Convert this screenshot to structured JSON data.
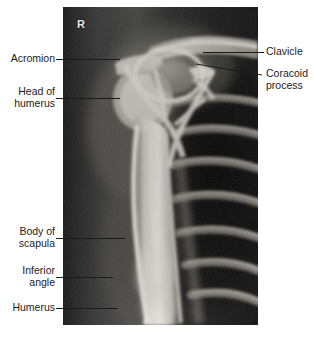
{
  "figure": {
    "type": "radiograph",
    "view": "lateral scapular / shoulder X-ray",
    "laterality_marker": "R",
    "background_color": "#ffffff",
    "panel": {
      "x": 63,
      "y": 7,
      "width": 195,
      "height": 318,
      "film_color": "#0b0b0b",
      "bone_color": "#f2f0ea"
    },
    "leader_line_color": "#1b1b1b"
  },
  "labels": {
    "left": [
      {
        "id": "acromion",
        "text": "Acromion",
        "lines": [
          "Acromion"
        ],
        "text_right_x": 55,
        "text_top_y": 53,
        "leader": {
          "x1": 56,
          "y1": 59,
          "x2": 120,
          "y2": 59
        }
      },
      {
        "id": "head-of-humerus",
        "text": "Head of humerus",
        "lines": [
          "Head of",
          "humerus"
        ],
        "text_right_x": 55,
        "text_top_y": 86,
        "leader": {
          "x1": 56,
          "y1": 98,
          "x2": 120,
          "y2": 98
        }
      },
      {
        "id": "body-of-scapula",
        "text": "Body of scapula",
        "lines": [
          "Body of",
          "scapula"
        ],
        "text_right_x": 55,
        "text_top_y": 226,
        "leader": {
          "x1": 56,
          "y1": 238,
          "x2": 125,
          "y2": 238
        }
      },
      {
        "id": "inferior-angle",
        "text": "Inferior angle",
        "lines": [
          "Inferior",
          "angle"
        ],
        "text_right_x": 55,
        "text_top_y": 265,
        "leader": {
          "x1": 56,
          "y1": 277,
          "x2": 113,
          "y2": 277
        }
      },
      {
        "id": "humerus",
        "text": "Humerus",
        "lines": [
          "Humerus"
        ],
        "text_right_x": 55,
        "text_top_y": 302,
        "leader": {
          "x1": 56,
          "y1": 308,
          "x2": 118,
          "y2": 308
        }
      }
    ],
    "right": [
      {
        "id": "clavicle",
        "text": "Clavicle",
        "lines": [
          "Clavicle"
        ],
        "text_left_x": 266,
        "text_top_y": 46,
        "leader": {
          "x1": 203,
          "y1": 52,
          "x2": 264,
          "y2": 52
        }
      },
      {
        "id": "coracoid-process",
        "text": "Coracoid process",
        "lines": [
          "Coracoid",
          "process"
        ],
        "text_left_x": 266,
        "text_top_y": 68,
        "leader": {
          "x1": 196,
          "y1": 64,
          "x2": 262,
          "y2": 75
        }
      }
    ]
  }
}
